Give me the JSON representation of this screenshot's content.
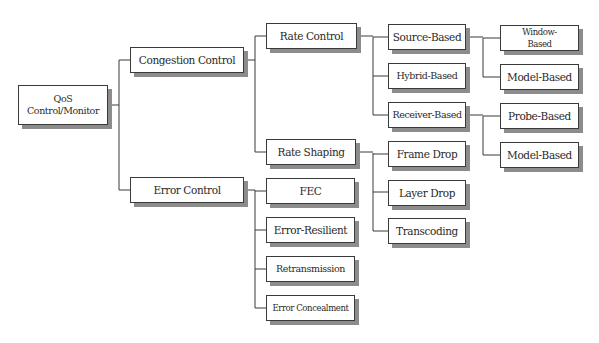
{
  "diagram": {
    "type": "tree",
    "root": {
      "id": "qos",
      "label_line1": "QoS",
      "label_line2": "Control/Monitor"
    },
    "nodes": {
      "congestion_control": "Congestion Control",
      "error_control": "Error Control",
      "rate_control": "Rate Control",
      "rate_shaping": "Rate Shaping",
      "fec": "FEC",
      "error_resilient": "Error-Resilient",
      "retransmission": "Retransmission",
      "error_concealment": "Error Concealment",
      "source_based": "Source-Based",
      "hybrid_based": "Hybrid-Based",
      "receiver_based": "Receiver-Based",
      "frame_drop": "Frame Drop",
      "layer_drop": "Layer Drop",
      "transcoding": "Transcoding",
      "window_based_line1": "Window-",
      "window_based_line2": "Based",
      "model_based_source": "Model-Based",
      "probe_based": "Probe-Based",
      "model_based_receiver": "Model-Based"
    },
    "edges": [
      [
        "QoS Control/Monitor",
        "Congestion Control"
      ],
      [
        "QoS Control/Monitor",
        "Error Control"
      ],
      [
        "Congestion Control",
        "Rate Control"
      ],
      [
        "Congestion Control",
        "Rate Shaping"
      ],
      [
        "Rate Control",
        "Source-Based"
      ],
      [
        "Rate Control",
        "Hybrid-Based"
      ],
      [
        "Rate Control",
        "Receiver-Based"
      ],
      [
        "Source-Based",
        "Window-Based"
      ],
      [
        "Source-Based",
        "Model-Based"
      ],
      [
        "Receiver-Based",
        "Probe-Based"
      ],
      [
        "Receiver-Based",
        "Model-Based"
      ],
      [
        "Rate Shaping",
        "Frame Drop"
      ],
      [
        "Rate Shaping",
        "Layer Drop"
      ],
      [
        "Rate Shaping",
        "Transcoding"
      ],
      [
        "Error Control",
        "FEC"
      ],
      [
        "Error Control",
        "Error-Resilient"
      ],
      [
        "Error Control",
        "Retransmission"
      ],
      [
        "Error Control",
        "Error Concealment"
      ]
    ],
    "colors": {
      "box_border": "#3a3a3a",
      "box_shadow": "#8c8c8c",
      "connector": "#3a3a3a",
      "background": "#ffffff"
    }
  }
}
